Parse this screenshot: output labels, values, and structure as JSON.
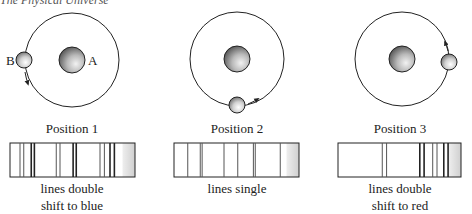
{
  "header": {
    "title": "The Physical Universe"
  },
  "panels": [
    {
      "id": "position-1",
      "position_label": "Position 1",
      "body_a_label": "A",
      "body_b_label": "B",
      "orbit_direction": "counterclockwise",
      "companion_location": "left",
      "spectrum": {
        "caption_line1": "lines double",
        "caption_line2": "shift to blue",
        "lines": [
          0.08,
          0.11,
          0.17,
          0.195,
          0.37,
          0.4,
          0.505,
          0.53,
          0.72,
          0.755,
          0.8,
          0.835
        ]
      }
    },
    {
      "id": "position-2",
      "position_label": "Position 2",
      "orbit_direction": "counterclockwise",
      "companion_location": "bottom",
      "spectrum": {
        "caption_line1": "lines single",
        "caption_line2": "",
        "lines": [
          0.11,
          0.21,
          0.225,
          0.4,
          0.51,
          0.635,
          0.65,
          0.85
        ]
      }
    },
    {
      "id": "position-3",
      "position_label": "Position 3",
      "orbit_direction": "counterclockwise",
      "companion_location": "right",
      "spectrum": {
        "caption_line1": "lines double",
        "caption_line2": "shift to red",
        "lines": [
          0.36,
          0.395,
          0.665,
          0.7,
          0.77,
          0.805,
          0.86,
          0.895
        ]
      }
    }
  ],
  "colors": {
    "stroke": "#222222",
    "gray_band": "#d8d8d8"
  }
}
